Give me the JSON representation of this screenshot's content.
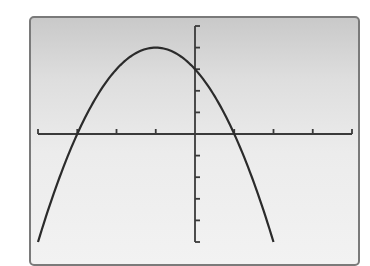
{
  "screen": {
    "background_top": "#c9c9c9",
    "background_bottom": "#f2f2f2",
    "border_color": "#7a7a7a",
    "curve_color": "#2b2b2b",
    "axis_color": "#3a3a3a"
  },
  "chart_data": {
    "type": "line",
    "title": "",
    "xlabel": "",
    "ylabel": "",
    "function": "y = -x^2 - 2x + 3",
    "xlim": [
      -4,
      4
    ],
    "ylim": [
      -5,
      5
    ],
    "xscale": 1,
    "yscale": 1,
    "grid": false,
    "legend": null,
    "x_ticks": [
      -4,
      -3,
      -2,
      -1,
      0,
      1,
      2,
      3,
      4
    ],
    "y_ticks": [
      -5,
      -4,
      -3,
      -2,
      -1,
      0,
      1,
      2,
      3,
      4,
      5
    ],
    "key_points": {
      "vertex": [
        -1,
        4
      ],
      "x_intercepts": [
        [
          -3,
          0
        ],
        [
          1,
          0
        ]
      ],
      "y_intercept": [
        0,
        3
      ]
    },
    "series": [
      {
        "name": "parabola",
        "x": [
          -4,
          -3.5,
          -3,
          -2.5,
          -2,
          -1.5,
          -1,
          -0.5,
          0,
          0.5,
          1,
          1.5,
          2
        ],
        "y": [
          -5,
          -2.25,
          0,
          1.75,
          3,
          3.75,
          4,
          3.75,
          3,
          1.75,
          0,
          -2.25,
          -5
        ]
      }
    ]
  }
}
